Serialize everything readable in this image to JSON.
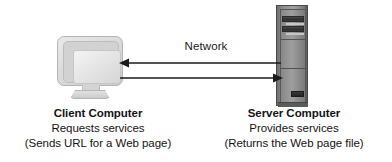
{
  "diagram": {
    "background_color": "#ffffff",
    "text_color": "#141414",
    "network_label": "Network",
    "client": {
      "icon": "crt-monitor-icon",
      "title": "Client Computer",
      "line1": "Requests services",
      "line2": "(Sends URL for a Web page)"
    },
    "server": {
      "icon": "server-tower-icon",
      "title": "Server Computer",
      "line1": "Provides services",
      "line2": "(Returns the Web page file)"
    },
    "arrows": [
      {
        "name": "arrow-server-to-client",
        "direction": "left",
        "description": "Response travels from server to client"
      },
      {
        "name": "arrow-client-to-server",
        "direction": "right",
        "description": "Request travels from client to server"
      }
    ],
    "arrow_color": "#1a1a1a"
  }
}
